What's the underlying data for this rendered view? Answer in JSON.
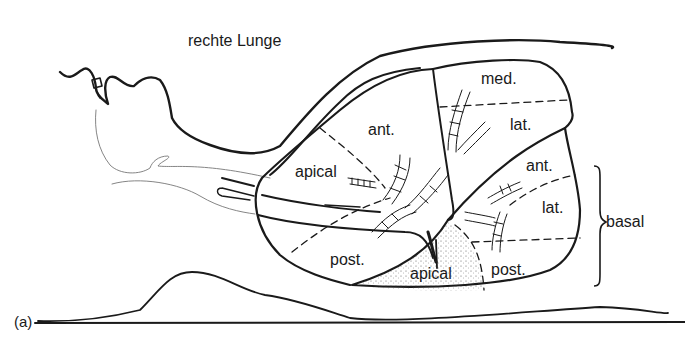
{
  "title": "rechte Lunge",
  "panel_label": "(a)",
  "upper_lobe": {
    "segments": [
      {
        "label": "apical"
      },
      {
        "label": "ant."
      },
      {
        "label": "post."
      }
    ]
  },
  "middle_lobe": {
    "segments": [
      {
        "label": "med."
      },
      {
        "label": "lat."
      }
    ]
  },
  "lower_lobe": {
    "apical_label": "apical",
    "basal_segments": [
      {
        "label": "ant."
      },
      {
        "label": "lat."
      },
      {
        "label": "post."
      }
    ],
    "basal_group_label": "basal"
  },
  "colors": {
    "ink": "#1a1a1a",
    "faint": "#777777",
    "background": "#ffffff"
  }
}
